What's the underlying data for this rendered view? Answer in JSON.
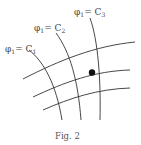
{
  "figure": {
    "caption": "Fig. 2",
    "labels": [
      {
        "name": "phi-c1",
        "phi": "φ",
        "sub": "1",
        "eq": "= C",
        "csub": "1"
      },
      {
        "name": "phi-c2",
        "phi": "φ",
        "sub": "1",
        "eq": "= C",
        "csub": "2"
      },
      {
        "name": "phi-c3",
        "phi": "φ",
        "sub": "1",
        "eq": "= C",
        "csub": "3"
      }
    ],
    "point": {
      "label": "marked-point"
    },
    "colors": {
      "line": "#333333",
      "point": "#111111",
      "background": "#ffffff"
    }
  }
}
